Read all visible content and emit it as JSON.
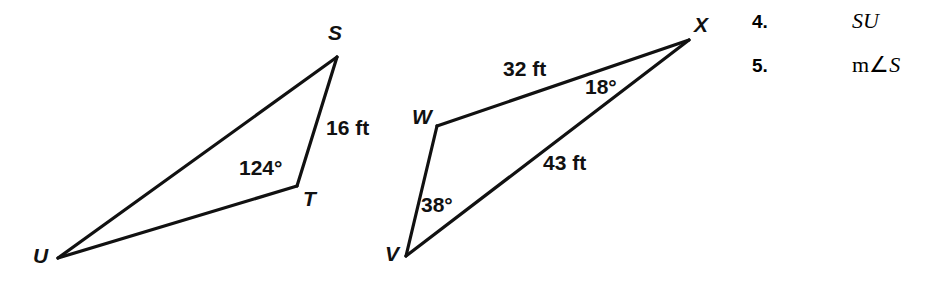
{
  "page": {
    "background_color": "#ffffff",
    "stroke_color": "#111111",
    "text_color": "#111111"
  },
  "figure": {
    "triangles": [
      {
        "name": "triangle-stu",
        "vertices": [
          {
            "label": "S",
            "x": 337,
            "y": 57,
            "label_x": 328,
            "label_y": 22
          },
          {
            "label": "T",
            "x": 297,
            "y": 186,
            "label_x": 303,
            "label_y": 188
          },
          {
            "label": "U",
            "x": 58,
            "y": 258,
            "label_x": 33,
            "label_y": 245
          }
        ],
        "edges": [
          {
            "from": "S",
            "to": "T",
            "measure": "16 ft"
          },
          {
            "from": "T",
            "to": "U",
            "measure": ""
          },
          {
            "from": "U",
            "to": "S",
            "measure": ""
          }
        ],
        "annotations": [
          {
            "name": "side-st-length",
            "text": "16 ft",
            "x": 326,
            "y": 117
          },
          {
            "name": "angle-t-measure",
            "text": "124°",
            "x": 239,
            "y": 157
          }
        ]
      },
      {
        "name": "triangle-vwx",
        "vertices": [
          {
            "label": "X",
            "x": 689,
            "y": 40,
            "label_x": 694,
            "label_y": 14
          },
          {
            "label": "W",
            "x": 437,
            "y": 126,
            "label_x": 412,
            "label_y": 106
          },
          {
            "label": "V",
            "x": 406,
            "y": 256,
            "label_x": 385,
            "label_y": 243
          }
        ],
        "edges": [
          {
            "from": "W",
            "to": "X",
            "measure": "32 ft"
          },
          {
            "from": "V",
            "to": "X",
            "measure": "43 ft"
          },
          {
            "from": "V",
            "to": "W",
            "measure": ""
          }
        ],
        "annotations": [
          {
            "name": "side-wx-length",
            "text": "32 ft",
            "x": 503,
            "y": 58
          },
          {
            "name": "angle-x-measure",
            "text": "18°",
            "x": 585,
            "y": 76
          },
          {
            "name": "side-vx-length",
            "text": "43 ft",
            "x": 543,
            "y": 152
          },
          {
            "name": "angle-v-measure",
            "text": "38°",
            "x": 421,
            "y": 194
          }
        ]
      }
    ]
  },
  "problems": [
    {
      "number": "4.",
      "expression_upright": "",
      "expression_italic": "SU"
    },
    {
      "number": "5.",
      "expression_upright": "m∠",
      "expression_italic": "S"
    }
  ]
}
